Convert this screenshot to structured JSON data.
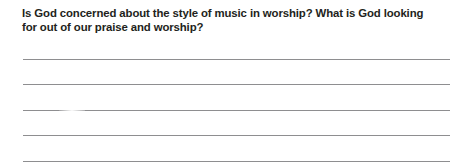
{
  "page": {
    "background_color": "#ffffff",
    "text_color": "#231f20",
    "rule_color": "#8e8e90"
  },
  "question": {
    "full_text": "Is God concerned about the style of music in worship? What is God looking for out of our praise and worship?",
    "lines": [
      "Is God concerned about the style of music in worship? What is God looking",
      "for out of our praise and worship?"
    ]
  },
  "answer_area": {
    "line_count": 5,
    "lines": [
      {
        "value": ""
      },
      {
        "value": ""
      },
      {
        "value": ""
      },
      {
        "value": ""
      },
      {
        "value": ""
      }
    ]
  }
}
